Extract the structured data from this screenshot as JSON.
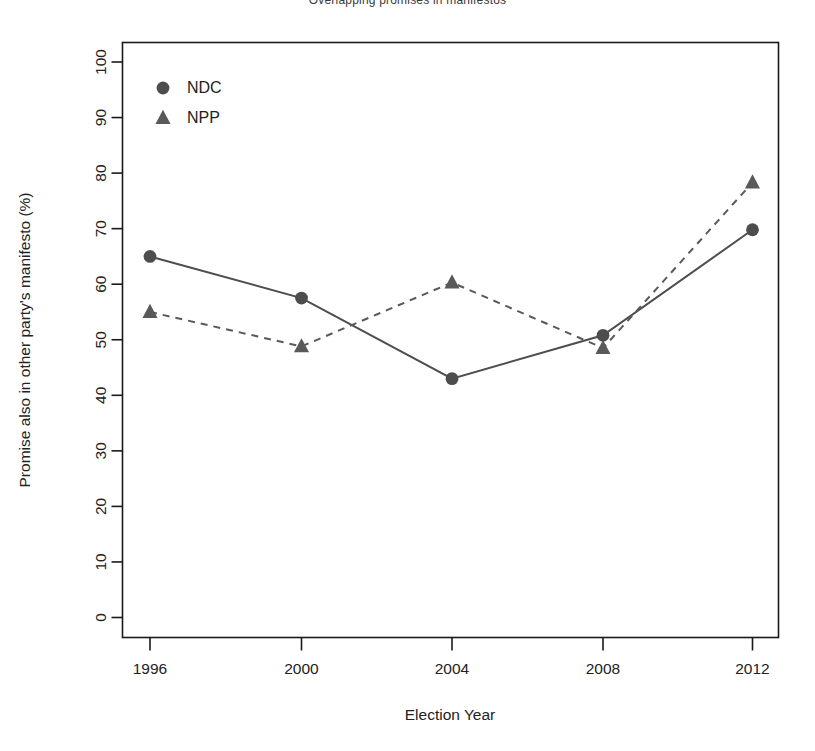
{
  "chart_data": {
    "type": "line",
    "title": "Overlapping promises in manifestos",
    "xlabel": "Election Year",
    "ylabel": "Promise also in other party's manifesto (%)",
    "x": [
      1996,
      2000,
      2004,
      2008,
      2012
    ],
    "categories": [
      "1996",
      "2000",
      "2004",
      "2008",
      "2012"
    ],
    "xtick_labels": [
      "1996",
      "2000",
      "2004",
      "2008",
      "2012"
    ],
    "ytick_labels": [
      "0",
      "10",
      "20",
      "30",
      "40",
      "50",
      "60",
      "70",
      "80",
      "90",
      "100"
    ],
    "ytick_values": [
      0,
      10,
      20,
      30,
      40,
      50,
      60,
      70,
      80,
      90,
      100
    ],
    "ylim": [
      0,
      104
    ],
    "xlim": [
      1994.4,
      2013.6
    ],
    "grid": false,
    "legend_position": "top-left",
    "series": [
      {
        "name": "NDC",
        "values": [
          65,
          57.5,
          43,
          50.8,
          69.8
        ],
        "marker": "circle",
        "linestyle": "solid",
        "color": "#4d4d4d"
      },
      {
        "name": "NPP",
        "values": [
          55,
          48.8,
          60.3,
          48.5,
          78.3
        ],
        "marker": "triangle",
        "linestyle": "dashed",
        "color": "#595959"
      }
    ]
  },
  "legend": {
    "entries": [
      {
        "label": "NDC",
        "marker": "circle"
      },
      {
        "label": "NPP",
        "marker": "triangle"
      }
    ]
  },
  "colors": {
    "ndc": "#4d4d4d",
    "npp": "#595959",
    "axis": "#1a1a1a",
    "background": "#ffffff"
  }
}
